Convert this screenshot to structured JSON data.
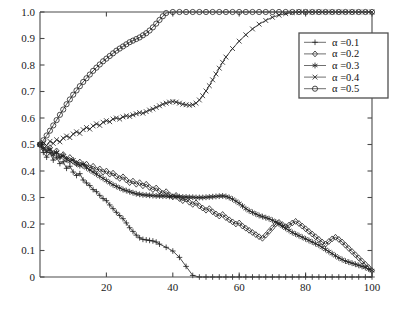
{
  "chart_data": {
    "type": "line",
    "title": "",
    "subtitle": "",
    "xlabel": "",
    "ylabel": "",
    "xlim": [
      0,
      100
    ],
    "ylim": [
      0,
      1.0
    ],
    "grid": false,
    "legend_position": "top-right",
    "xticks": [
      20,
      40,
      60,
      80,
      100
    ],
    "xtick_labels": [
      "20",
      "40",
      "60",
      "80",
      "100"
    ],
    "yticks": [
      0,
      0.1,
      0.2,
      0.3,
      0.4,
      0.5,
      0.6,
      0.7,
      0.8,
      0.9,
      1.0
    ],
    "ytick_labels": [
      "0",
      "0.1",
      "0.2",
      "0.3",
      "0.4",
      "0.5",
      "0.6",
      "0.7",
      "0.8",
      "0.9",
      "1.0"
    ],
    "series": [
      {
        "name": "α =0.1",
        "marker": "plus",
        "color": "#2b2b2b",
        "x": [
          0,
          1,
          2,
          3,
          4,
          5,
          6,
          7,
          8,
          9,
          10,
          11,
          12,
          13,
          14,
          15,
          16,
          17,
          18,
          19,
          20,
          21,
          22,
          23,
          24,
          25,
          26,
          27,
          28,
          29,
          30,
          31,
          32,
          33,
          34,
          35,
          36,
          38,
          40,
          42,
          44,
          46,
          48,
          50,
          52,
          54,
          56,
          58,
          60,
          62,
          64,
          66,
          68,
          70,
          72,
          74,
          76,
          78,
          80,
          82,
          84,
          86,
          88,
          90,
          92,
          94,
          96,
          98,
          100
        ],
        "values": [
          0.5,
          0.47,
          0.452,
          0.47,
          0.441,
          0.452,
          0.428,
          0.435,
          0.41,
          0.418,
          0.396,
          0.383,
          0.39,
          0.366,
          0.355,
          0.345,
          0.33,
          0.322,
          0.308,
          0.296,
          0.288,
          0.272,
          0.258,
          0.244,
          0.232,
          0.22,
          0.204,
          0.186,
          0.172,
          0.158,
          0.148,
          0.142,
          0.14,
          0.138,
          0.136,
          0.132,
          0.124,
          0.112,
          0.098,
          0.074,
          0.04,
          0.006,
          0.0,
          0.0,
          0.0,
          0.0,
          0.0,
          0.0,
          0.0,
          0.0,
          0.0,
          0.0,
          0.0,
          0.0,
          0.0,
          0.0,
          0.0,
          0.0,
          0.0,
          0.0,
          0.0,
          0.0,
          0.0,
          0.0,
          0.0,
          0.0,
          0.0,
          0.0,
          0.0
        ]
      },
      {
        "name": "α =0.2",
        "marker": "diamond",
        "color": "#2b2b2b",
        "x": [
          0,
          1,
          2,
          3,
          4,
          5,
          6,
          7,
          8,
          9,
          10,
          11,
          12,
          13,
          14,
          15,
          16,
          17,
          18,
          19,
          20,
          21,
          22,
          23,
          24,
          25,
          26,
          27,
          28,
          29,
          30,
          31,
          32,
          33,
          34,
          35,
          36,
          37,
          38,
          39,
          40,
          41,
          42,
          43,
          44,
          45,
          46,
          47,
          48,
          49,
          50,
          51,
          52,
          53,
          54,
          55,
          56,
          57,
          58,
          59,
          60,
          61,
          62,
          63,
          64,
          65,
          66,
          67,
          68,
          69,
          70,
          71,
          72,
          73,
          74,
          75,
          76,
          77,
          78,
          79,
          80,
          81,
          82,
          83,
          84,
          85,
          86,
          87,
          88,
          89,
          90,
          91,
          92,
          93,
          94,
          95,
          96,
          97,
          98,
          99,
          100
        ],
        "values": [
          0.5,
          0.492,
          0.478,
          0.488,
          0.466,
          0.476,
          0.455,
          0.462,
          0.444,
          0.451,
          0.436,
          0.428,
          0.434,
          0.42,
          0.426,
          0.412,
          0.418,
          0.404,
          0.408,
          0.396,
          0.4,
          0.388,
          0.392,
          0.38,
          0.372,
          0.378,
          0.366,
          0.356,
          0.362,
          0.35,
          0.356,
          0.344,
          0.35,
          0.338,
          0.33,
          0.336,
          0.324,
          0.316,
          0.322,
          0.31,
          0.302,
          0.308,
          0.296,
          0.288,
          0.294,
          0.282,
          0.274,
          0.28,
          0.268,
          0.26,
          0.252,
          0.258,
          0.246,
          0.238,
          0.23,
          0.236,
          0.224,
          0.216,
          0.208,
          0.2,
          0.204,
          0.192,
          0.184,
          0.176,
          0.168,
          0.16,
          0.152,
          0.146,
          0.158,
          0.172,
          0.186,
          0.2,
          0.206,
          0.198,
          0.19,
          0.196,
          0.204,
          0.21,
          0.202,
          0.192,
          0.182,
          0.172,
          0.162,
          0.152,
          0.142,
          0.132,
          0.124,
          0.134,
          0.144,
          0.15,
          0.142,
          0.132,
          0.12,
          0.108,
          0.096,
          0.084,
          0.072,
          0.06,
          0.048,
          0.036,
          0.024
        ]
      },
      {
        "name": "α =0.3",
        "marker": "star",
        "color": "#2b2b2b",
        "x": [
          0,
          1,
          2,
          3,
          4,
          5,
          6,
          7,
          8,
          9,
          10,
          11,
          12,
          13,
          14,
          15,
          16,
          17,
          18,
          19,
          20,
          21,
          22,
          23,
          24,
          25,
          26,
          27,
          28,
          29,
          30,
          31,
          32,
          33,
          34,
          35,
          36,
          37,
          38,
          39,
          40,
          41,
          42,
          43,
          44,
          45,
          46,
          47,
          48,
          49,
          50,
          51,
          52,
          53,
          54,
          55,
          56,
          57,
          58,
          59,
          60,
          61,
          62,
          63,
          64,
          65,
          66,
          67,
          68,
          69,
          70,
          71,
          72,
          73,
          74,
          75,
          76,
          77,
          78,
          79,
          80,
          81,
          82,
          83,
          84,
          85,
          86,
          87,
          88,
          89,
          90,
          91,
          92,
          93,
          94,
          95,
          96,
          97,
          98,
          99,
          100
        ],
        "values": [
          0.5,
          0.486,
          0.474,
          0.482,
          0.462,
          0.47,
          0.452,
          0.458,
          0.444,
          0.436,
          0.442,
          0.428,
          0.42,
          0.426,
          0.412,
          0.404,
          0.396,
          0.388,
          0.38,
          0.372,
          0.364,
          0.356,
          0.348,
          0.342,
          0.336,
          0.33,
          0.326,
          0.322,
          0.318,
          0.314,
          0.312,
          0.31,
          0.309,
          0.308,
          0.307,
          0.306,
          0.306,
          0.305,
          0.305,
          0.304,
          0.304,
          0.303,
          0.303,
          0.302,
          0.302,
          0.301,
          0.301,
          0.3,
          0.3,
          0.3,
          0.301,
          0.302,
          0.303,
          0.304,
          0.305,
          0.306,
          0.304,
          0.3,
          0.294,
          0.286,
          0.278,
          0.268,
          0.258,
          0.25,
          0.244,
          0.238,
          0.232,
          0.228,
          0.224,
          0.22,
          0.214,
          0.208,
          0.2,
          0.192,
          0.184,
          0.176,
          0.168,
          0.162,
          0.156,
          0.15,
          0.144,
          0.138,
          0.132,
          0.126,
          0.12,
          0.112,
          0.104,
          0.096,
          0.088,
          0.08,
          0.072,
          0.066,
          0.06,
          0.056,
          0.052,
          0.048,
          0.044,
          0.04,
          0.036,
          0.03,
          0.024
        ]
      },
      {
        "name": "α =0.4",
        "marker": "x",
        "color": "#2b2b2b",
        "x": [
          0,
          1,
          2,
          3,
          4,
          5,
          6,
          7,
          8,
          9,
          10,
          11,
          12,
          13,
          14,
          15,
          16,
          17,
          18,
          19,
          20,
          21,
          22,
          23,
          24,
          25,
          26,
          27,
          28,
          29,
          30,
          31,
          32,
          33,
          34,
          35,
          36,
          37,
          38,
          39,
          40,
          41,
          42,
          43,
          44,
          45,
          46,
          47,
          48,
          49,
          50,
          51,
          52,
          53,
          54,
          55,
          56,
          58,
          60,
          62,
          64,
          66,
          68,
          70,
          72,
          74,
          76,
          78,
          80,
          82,
          84,
          86,
          88,
          90,
          92,
          94,
          96,
          98,
          100
        ],
        "values": [
          0.5,
          0.508,
          0.496,
          0.512,
          0.504,
          0.518,
          0.51,
          0.524,
          0.532,
          0.526,
          0.54,
          0.548,
          0.542,
          0.556,
          0.564,
          0.558,
          0.57,
          0.578,
          0.572,
          0.584,
          0.59,
          0.586,
          0.596,
          0.6,
          0.596,
          0.604,
          0.608,
          0.606,
          0.612,
          0.616,
          0.62,
          0.618,
          0.624,
          0.63,
          0.634,
          0.64,
          0.646,
          0.652,
          0.656,
          0.66,
          0.662,
          0.66,
          0.656,
          0.652,
          0.65,
          0.648,
          0.65,
          0.656,
          0.668,
          0.684,
          0.702,
          0.722,
          0.744,
          0.766,
          0.788,
          0.81,
          0.83,
          0.862,
          0.89,
          0.914,
          0.936,
          0.954,
          0.968,
          0.98,
          0.988,
          0.994,
          0.998,
          1.0,
          1.0,
          1.0,
          1.0,
          1.0,
          1.0,
          1.0,
          1.0,
          1.0,
          1.0,
          1.0,
          1.0
        ]
      },
      {
        "name": "α =0.5",
        "marker": "circle",
        "color": "#2b2b2b",
        "x": [
          0,
          1,
          2,
          3,
          4,
          5,
          6,
          7,
          8,
          9,
          10,
          11,
          12,
          13,
          14,
          15,
          16,
          17,
          18,
          19,
          20,
          21,
          22,
          23,
          24,
          25,
          26,
          27,
          28,
          29,
          30,
          31,
          32,
          33,
          34,
          35,
          36,
          37,
          38,
          40,
          42,
          44,
          46,
          48,
          50,
          52,
          54,
          56,
          58,
          60,
          62,
          64,
          66,
          68,
          70,
          72,
          74,
          76,
          78,
          80,
          82,
          84,
          86,
          88,
          90,
          92,
          94,
          96,
          98,
          100
        ],
        "values": [
          0.5,
          0.516,
          0.534,
          0.552,
          0.572,
          0.592,
          0.612,
          0.632,
          0.652,
          0.67,
          0.688,
          0.704,
          0.72,
          0.736,
          0.75,
          0.764,
          0.778,
          0.79,
          0.802,
          0.814,
          0.824,
          0.834,
          0.844,
          0.854,
          0.862,
          0.87,
          0.878,
          0.886,
          0.892,
          0.898,
          0.904,
          0.912,
          0.92,
          0.93,
          0.942,
          0.956,
          0.97,
          0.984,
          0.996,
          1.0,
          1.0,
          1.0,
          1.0,
          1.0,
          1.0,
          1.0,
          1.0,
          1.0,
          1.0,
          1.0,
          1.0,
          1.0,
          1.0,
          1.0,
          1.0,
          1.0,
          1.0,
          1.0,
          1.0,
          1.0,
          1.0,
          1.0,
          1.0,
          1.0,
          1.0,
          1.0,
          1.0,
          1.0,
          1.0,
          1.0
        ]
      }
    ]
  },
  "legend": {
    "entries": [
      {
        "label": "α =0.1",
        "marker": "plus"
      },
      {
        "label": "α =0.2",
        "marker": "diamond"
      },
      {
        "label": "α =0.3",
        "marker": "star"
      },
      {
        "label": "α =0.4",
        "marker": "x"
      },
      {
        "label": "α =0.5",
        "marker": "circle"
      }
    ]
  }
}
